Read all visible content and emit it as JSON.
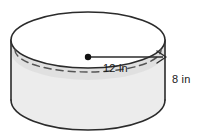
{
  "figure": {
    "kind": "cylinder-diagram",
    "alt": "Right circular cylinder with radius and height labeled",
    "background_color": "#ffffff",
    "stroke_color": "#2b2b2b",
    "top_face_fill": "#ffffff",
    "side_wall_fill": "#ececec",
    "side_wall_shadow": "#d8d8d8",
    "dashed_arc_color": "#4a4a4a",
    "center_dot_color": "#111111",
    "labels": {
      "radius": "12 in",
      "height": "8 in"
    },
    "geometry": {
      "top_ellipse_center_x": 88,
      "top_ellipse_center_y": 40,
      "top_ellipse_rx": 77,
      "top_ellipse_ry": 28,
      "bottom_ellipse_center_y": 100,
      "bottom_ellipse_ry": 30,
      "left_edge_x": 11,
      "right_edge_x": 165,
      "radius_arrow_start_x": 88,
      "radius_arrow_end_x": 165,
      "radius_arrow_y": 57
    },
    "measurements": {
      "radius_value": 12,
      "radius_unit": "in",
      "height_value": 8,
      "height_unit": "in"
    }
  }
}
